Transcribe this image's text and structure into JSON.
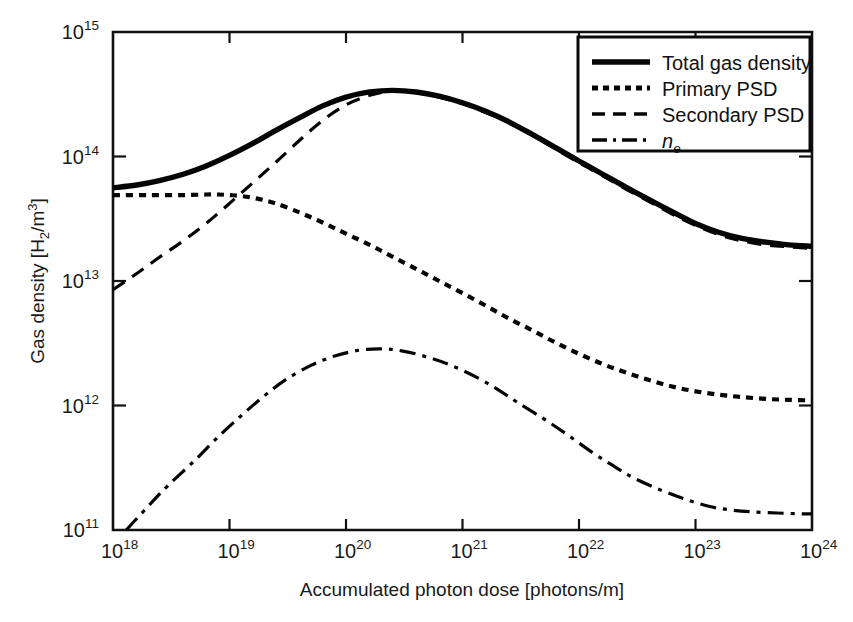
{
  "chart_data": {
    "type": "line",
    "title": "",
    "xlabel": "Accumulated photon dose [photons/m]",
    "ylabel": "Gas density [H2/m3]",
    "ylabel_parts": {
      "lead": "Gas density [H",
      "sub": "2",
      "mid": "/m",
      "sup": "3",
      "tail": "]"
    },
    "xscale": "log",
    "yscale": "log",
    "xlim": [
      1e+18,
      1e+24
    ],
    "ylim": [
      100000000000.0,
      1000000000000000.0
    ],
    "grid": false,
    "legend_position": "top-right",
    "xticks": [
      "10^18",
      "10^19",
      "10^20",
      "10^21",
      "10^22",
      "10^23",
      "10^24"
    ],
    "xtick_mantissa": "10",
    "xtick_exponents": [
      "18",
      "19",
      "20",
      "21",
      "22",
      "23",
      "24"
    ],
    "ytick_exponents": [
      "11",
      "12",
      "13",
      "14",
      "15"
    ],
    "ytick_mantissa": "10",
    "series": [
      {
        "name": "Total gas density",
        "style": "solid",
        "x": [
          1e+18,
          1.6e+18,
          2.5e+18,
          4e+18,
          6.3e+18,
          1e+19,
          1.6e+19,
          2.5e+19,
          4e+19,
          6.3e+19,
          1e+20,
          1.6e+20,
          2.5e+20,
          4e+20,
          6.3e+20,
          1e+21,
          1.6e+21,
          2.5e+21,
          4e+21,
          6.3e+21,
          1e+22,
          1.6e+22,
          2.5e+22,
          4e+22,
          6.3e+22,
          1e+23,
          1.6e+23,
          2.5e+23,
          4e+23,
          6.3e+23,
          1e+24
        ],
        "y": [
          56000000000000.0,
          59000000000000.0,
          64000000000000.0,
          72000000000000.0,
          84000000000000.0,
          102000000000000.0,
          128000000000000.0,
          162000000000000.0,
          205000000000000.0,
          255000000000000.0,
          300000000000000.0,
          330000000000000.0,
          340000000000000.0,
          330000000000000.0,
          305000000000000.0,
          270000000000000.0,
          230000000000000.0,
          190000000000000.0,
          150000000000000.0,
          118000000000000.0,
          92000000000000.0,
          72000000000000.0,
          57000000000000.0,
          45000000000000.0,
          36000000000000.0,
          29000000000000.0,
          24500000000000.0,
          22000000000000.0,
          20500000000000.0,
          19500000000000.0,
          19000000000000.0
        ]
      },
      {
        "name": "Primary PSD",
        "style": "dotted",
        "x": [
          1e+18,
          2e+18,
          4e+18,
          6.3e+18,
          8e+18,
          1e+19,
          1.3e+19,
          1.8e+19,
          2.5e+19,
          4e+19,
          6.3e+19,
          1e+20,
          1.6e+20,
          2.5e+20,
          4e+20,
          6.3e+20,
          1e+21,
          1.6e+21,
          2.5e+21,
          4e+21,
          6.3e+21,
          1e+22,
          1.6e+22,
          2.5e+22,
          4e+22,
          6.3e+22,
          1e+23,
          1.6e+23,
          2.5e+23,
          4e+23,
          6.3e+23,
          1e+24
        ],
        "y": [
          49000000000000.0,
          49000000000000.0,
          49000000000000.0,
          49500000000000.0,
          49500000000000.0,
          49000000000000.0,
          48000000000000.0,
          45500000000000.0,
          42000000000000.0,
          35500000000000.0,
          29500000000000.0,
          24000000000000.0,
          19500000000000.0,
          15700000000000.0,
          12500000000000.0,
          10000000000000.0,
          8000000000000.0,
          6300000000000.0,
          5000000000000.0,
          4000000000000.0,
          3200000000000.0,
          2600000000000.0,
          2150000000000.0,
          1850000000000.0,
          1600000000000.0,
          1420000000000.0,
          1300000000000.0,
          1220000000000.0,
          1170000000000.0,
          1130000000000.0,
          1110000000000.0,
          1100000000000.0
        ]
      },
      {
        "name": "Secondary PSD",
        "style": "dashed",
        "x": [
          1e+18,
          1.6e+18,
          2.5e+18,
          4e+18,
          6.3e+18,
          1e+19,
          1.6e+19,
          2.5e+19,
          4e+19,
          6.3e+19,
          1e+20,
          1.6e+20,
          2.5e+20,
          4e+20,
          6.3e+20,
          1e+21,
          1.6e+21,
          2.5e+21,
          4e+21,
          6.3e+21,
          1e+22,
          1.6e+22,
          2.5e+22,
          4e+22,
          6.3e+22,
          1e+23,
          1.6e+23,
          2.5e+23,
          4e+23,
          6.3e+23,
          1e+24
        ],
        "y": [
          8500000000000.0,
          11500000000000.0,
          15500000000000.0,
          21000000000000.0,
          29000000000000.0,
          42000000000000.0,
          62000000000000.0,
          90000000000000.0,
          135000000000000.0,
          195000000000000.0,
          260000000000000.0,
          310000000000000.0,
          335000000000000.0,
          325000000000000.0,
          300000000000000.0,
          265000000000000.0,
          225000000000000.0,
          187000000000000.0,
          147000000000000.0,
          115000000000000.0,
          89000000000000.0,
          70000000000000.0,
          55000000000000.0,
          43500000000000.0,
          34500000000000.0,
          28000000000000.0,
          23500000000000.0,
          21000000000000.0,
          19500000000000.0,
          18800000000000.0,
          18300000000000.0
        ]
      },
      {
        "name": "n_e",
        "style": "dashdot",
        "x": [
          1.3e+18,
          2e+18,
          3e+18,
          5e+18,
          8e+18,
          1.3e+19,
          2e+19,
          3e+19,
          5e+19,
          8e+19,
          1.3e+20,
          2e+20,
          3e+20,
          5e+20,
          8e+20,
          1.3e+21,
          2e+21,
          3e+21,
          5e+21,
          8e+21,
          1.3e+22,
          2e+22,
          3e+22,
          5e+22,
          8e+22,
          1.3e+23,
          2e+23,
          3e+23,
          5e+23,
          8e+23,
          1e+24
        ],
        "y": [
          100000000000.0,
          155000000000.0,
          230000000000.0,
          360000000000.0,
          560000000000.0,
          850000000000.0,
          1200000000000.0,
          1600000000000.0,
          2100000000000.0,
          2500000000000.0,
          2780000000000.0,
          2850000000000.0,
          2750000000000.0,
          2450000000000.0,
          2100000000000.0,
          1700000000000.0,
          1350000000000.0,
          1050000000000.0,
          780000000000.0,
          580000000000.0,
          420000000000.0,
          325000000000.0,
          260000000000.0,
          210000000000.0,
          178000000000.0,
          155000000000.0,
          145000000000.0,
          140000000000.0,
          137000000000.0,
          135000000000.0,
          135000000000.0
        ]
      }
    ],
    "legend": [
      {
        "label": "Total gas density",
        "style": "solid"
      },
      {
        "label": "Primary PSD",
        "style": "dotted"
      },
      {
        "label": "Secondary PSD",
        "style": "dashed"
      },
      {
        "label": "n",
        "label_sub": "e",
        "style": "dashdot"
      }
    ]
  }
}
